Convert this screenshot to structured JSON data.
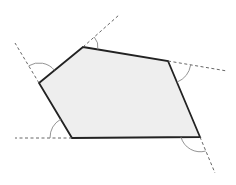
{
  "diagram": {
    "colors": {
      "fill": "#eeeeee",
      "edge": "#222222",
      "extension": "#555555",
      "arc": "#888888",
      "background": "#ffffff"
    },
    "vertices": [
      {
        "name": "top",
        "x": 83,
        "y": 47
      },
      {
        "name": "right",
        "x": 168,
        "y": 61
      },
      {
        "name": "bottom-right",
        "x": 200,
        "y": 137
      },
      {
        "name": "bottom-left",
        "x": 72,
        "y": 138
      },
      {
        "name": "left",
        "x": 39,
        "y": 83
      }
    ],
    "extensions": [
      {
        "from": "top",
        "x1": 83,
        "y1": 47,
        "x2": 119,
        "y2": 15
      },
      {
        "from": "right",
        "x1": 168,
        "y1": 61,
        "x2": 227,
        "y2": 71
      },
      {
        "from": "bottom-right",
        "x1": 200,
        "y1": 137,
        "x2": 215,
        "y2": 173
      },
      {
        "from": "bottom-left",
        "x1": 72,
        "y1": 138,
        "x2": 15,
        "y2": 138
      },
      {
        "from": "left",
        "x1": 39,
        "y1": 83,
        "x2": 15,
        "y2": 43
      }
    ],
    "exterior_angle_arcs": 5
  }
}
